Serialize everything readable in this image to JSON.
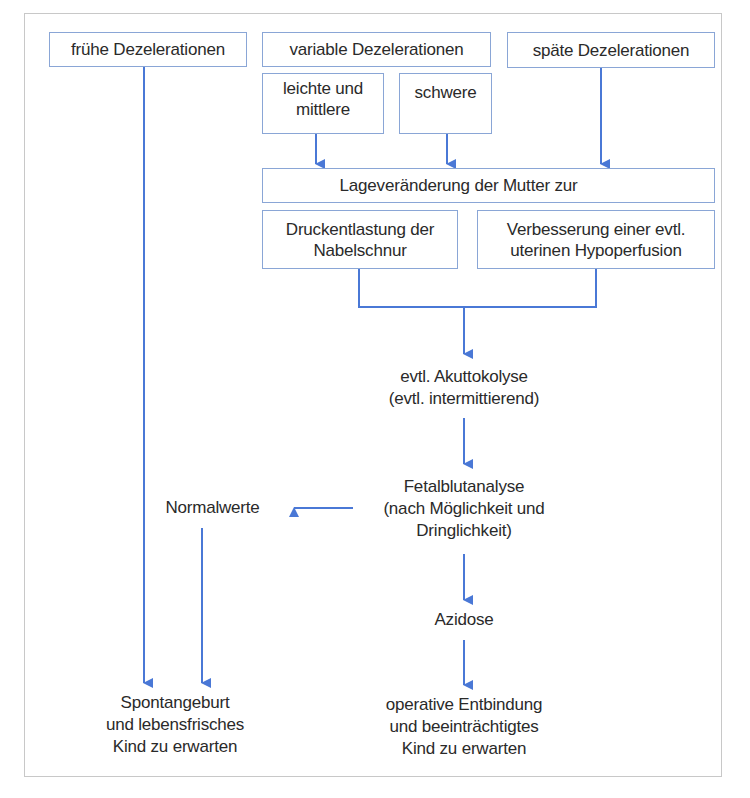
{
  "diagram": {
    "type": "flowchart",
    "colors": {
      "arrow": "#4a78d6",
      "box_border": "#8aa6d6",
      "frame": "#c8c8c8",
      "text": "#2a2a2a"
    },
    "nodes": {
      "fruehe": "frühe Dezelerationen",
      "variable": "variable Dezelerationen",
      "leichte": "leichte und\nmittlere",
      "schwere": "schwere",
      "spaete": "späte Dezelerationen",
      "lageveraenderung": "Lageveränderung der Mutter zur",
      "druckentlastung": "Druckentlastung der\nNabelschnur",
      "verbesserung": "Verbesserung einer evtl.\nuterinen Hypoperfusion",
      "akuttokolyse": "evtl. Akuttokolyse\n(evtl. intermittierend)",
      "fetalblutanalyse": "Fetalblutanalyse\n(nach Möglichkeit und\nDringlichkeit)",
      "normalwerte": "Normalwerte",
      "azidose": "Azidose",
      "spontangeburt": "Spontangeburt\nund lebensfrisches\nKind zu erwarten",
      "operative": "operative Entbindung\nund beeinträchtigtes\nKind zu erwarten"
    },
    "edges": [
      {
        "from": "fruehe",
        "to": "spontangeburt"
      },
      {
        "from": "leichte",
        "to": "lageveraenderung"
      },
      {
        "from": "schwere",
        "to": "lageveraenderung"
      },
      {
        "from": "spaete",
        "to": "lageveraenderung"
      },
      {
        "from": "druckentlastung",
        "to": "akuttokolyse"
      },
      {
        "from": "verbesserung",
        "to": "akuttokolyse"
      },
      {
        "from": "akuttokolyse",
        "to": "fetalblutanalyse"
      },
      {
        "from": "fetalblutanalyse",
        "to": "normalwerte"
      },
      {
        "from": "normalwerte",
        "to": "spontangeburt"
      },
      {
        "from": "fetalblutanalyse",
        "to": "azidose"
      },
      {
        "from": "azidose",
        "to": "operative"
      }
    ]
  }
}
